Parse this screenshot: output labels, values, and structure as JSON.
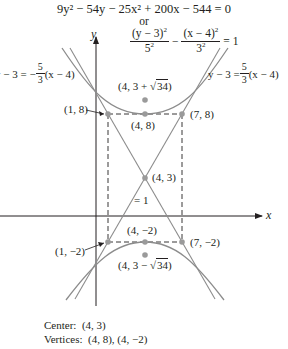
{
  "header": {
    "general_form": "9y² − 54y − 25x² + 200x − 544 = 0",
    "or_text": "or",
    "standard_form": {
      "term1_num": "(y − 3)",
      "term1_num_exp": "2",
      "term1_den": "5",
      "term1_den_exp": "2",
      "minus": "−",
      "term2_num": "(x − 4)",
      "term2_num_exp": "2",
      "term2_den": "3",
      "term2_den_exp": "2",
      "rhs": "= 1"
    }
  },
  "axes": {
    "x_label": "x",
    "y_label": "y"
  },
  "asymptotes": {
    "left": {
      "prefix": "y − 3 = −",
      "num": "5",
      "den": "3",
      "suffix": "(x − 4)"
    },
    "right": {
      "prefix": "y − 3 = ",
      "num": "5",
      "den": "3",
      "suffix": "(x − 4)"
    }
  },
  "points": {
    "focus_top": {
      "prefix": "(4, 3 + ",
      "radicand": "34",
      "suffix": ")"
    },
    "box_top_left": "(1, 8)",
    "vertex_top": "(4, 8)",
    "box_top_right": "(7, 8)",
    "center": "(4, 3)",
    "box_bottom_left": "(1, −2)",
    "vertex_bottom": "(4, −2)",
    "box_bottom_right": "(7, −2)",
    "focus_bottom": {
      "prefix": "(4, 3 − ",
      "radicand": "34",
      "suffix": ")"
    }
  },
  "stray_label": "= 1",
  "caption": {
    "center_label": "Center:",
    "center_value": "(4, 3)",
    "vertices_label": "Vertices:",
    "vertices_value": "(4, 8), (4, −2)"
  },
  "colors": {
    "curve": "#8c8c8c",
    "point": "#9a9a9a",
    "axis": "#231f20",
    "text": "#231f20"
  }
}
